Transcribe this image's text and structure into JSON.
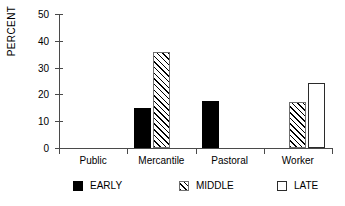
{
  "chart_data": {
    "type": "bar",
    "title": "",
    "xlabel": "",
    "ylabel": "PERCENT",
    "ylim": [
      0,
      50
    ],
    "yticks": [
      0,
      10,
      20,
      30,
      40,
      50
    ],
    "grid": false,
    "legend_position": "bottom",
    "categories": [
      "Public",
      "Mercantile",
      "Pastoral",
      "Worker"
    ],
    "series": [
      {
        "name": "EARLY",
        "values": [
          0,
          15,
          17.7,
          0
        ]
      },
      {
        "name": "MIDDLE",
        "values": [
          0,
          35.8,
          0,
          17
        ]
      },
      {
        "name": "LATE",
        "values": [
          0,
          0,
          0,
          24.2
        ]
      }
    ],
    "legend": [
      {
        "label": "EARLY",
        "swatch": "filled-black-square"
      },
      {
        "label": "MIDDLE",
        "swatch": "hatched-square"
      },
      {
        "label": "LATE",
        "swatch": "empty-square"
      }
    ]
  },
  "colors": {
    "early": "#000000",
    "middle_hatch": "#000000",
    "late": "#ffffff",
    "axis": "#4a4a4a",
    "background": "#ffffff"
  }
}
